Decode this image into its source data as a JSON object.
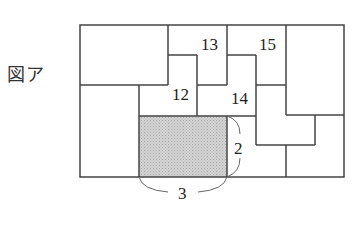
{
  "figure": {
    "label": "図ア"
  },
  "diagram": {
    "stroke_color": "#444444",
    "shade_color": "#d0d0d0",
    "piece_labels": [
      "12",
      "13",
      "14",
      "15"
    ],
    "dimension_labels": {
      "width": "3",
      "height": "2"
    },
    "shaded_piece": {
      "width": 3,
      "height": 2
    }
  }
}
